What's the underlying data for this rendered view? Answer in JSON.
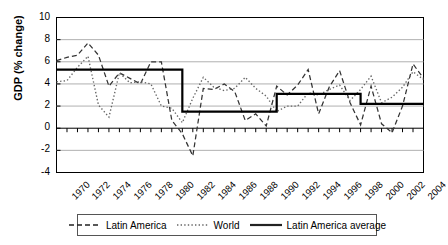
{
  "chart_data": {
    "type": "line",
    "title": "",
    "xlabel": "",
    "ylabel": "GDP (% change)",
    "ylim": [
      -4,
      10
    ],
    "xlim": [
      1970,
      2005
    ],
    "grid": true,
    "legend_position": "bottom",
    "ytick_labels": [
      "10",
      "8",
      "6",
      "4",
      "2",
      "0",
      "-2",
      "-4"
    ],
    "ytick_values": [
      10,
      8,
      6,
      4,
      2,
      0,
      -2,
      -4
    ],
    "xtick_labels": [
      "1970",
      "1972",
      "1974",
      "1976",
      "1978",
      "1980",
      "1982",
      "1984",
      "1986",
      "1988",
      "1990",
      "1992",
      "1994",
      "1996",
      "1998",
      "2000",
      "2002",
      "2004"
    ],
    "xtick_values": [
      1970,
      1972,
      1974,
      1976,
      1978,
      1980,
      1982,
      1984,
      1986,
      1988,
      1990,
      1992,
      1994,
      1996,
      1998,
      2000,
      2002,
      2004
    ],
    "x": [
      1970,
      1971,
      1972,
      1973,
      1974,
      1975,
      1976,
      1977,
      1978,
      1979,
      1980,
      1981,
      1982,
      1983,
      1984,
      1985,
      1986,
      1987,
      1988,
      1989,
      1990,
      1991,
      1992,
      1993,
      1994,
      1995,
      1996,
      1997,
      1998,
      1999,
      2000,
      2001,
      2002,
      2003,
      2004,
      2005
    ],
    "series": [
      {
        "name": "Latin America",
        "style": "dashed",
        "color": "#333333",
        "values": [
          6.1,
          6.4,
          6.6,
          7.7,
          6.6,
          3.8,
          5.0,
          4.5,
          4.0,
          6.0,
          6.0,
          0.7,
          -0.5,
          -2.5,
          3.6,
          3.5,
          4.0,
          3.3,
          0.7,
          1.3,
          0.2,
          3.8,
          3.0,
          3.9,
          5.3,
          1.3,
          3.7,
          5.2,
          2.3,
          0.3,
          3.8,
          0.4,
          -0.4,
          2.0,
          5.8,
          4.5
        ]
      },
      {
        "name": "World",
        "style": "dotted",
        "color": "#666666",
        "values": [
          4.2,
          4.3,
          5.5,
          6.5,
          2.1,
          1.0,
          5.0,
          4.1,
          4.2,
          4.0,
          2.0,
          1.8,
          0.5,
          2.7,
          4.6,
          3.7,
          3.4,
          3.6,
          4.6,
          3.6,
          2.9,
          1.5,
          2.0,
          2.0,
          3.2,
          3.0,
          3.5,
          3.9,
          2.5,
          3.5,
          4.7,
          2.3,
          2.8,
          3.7,
          5.1,
          4.4
        ]
      },
      {
        "name": "Latin America average",
        "style": "solid-step",
        "color": "#000000",
        "segments": [
          {
            "start": 1970,
            "end": 1981,
            "value": 5.3
          },
          {
            "start": 1982,
            "end": 1990,
            "value": 1.5
          },
          {
            "start": 1991,
            "end": 1998,
            "value": 3.1
          },
          {
            "start": 1999,
            "end": 2005,
            "value": 2.2
          }
        ]
      }
    ]
  },
  "legend": {
    "items": [
      {
        "label": "Latin America",
        "style": "dashed"
      },
      {
        "label": "World",
        "style": "dotted"
      },
      {
        "label": "Latin America average",
        "style": "solid"
      }
    ]
  }
}
